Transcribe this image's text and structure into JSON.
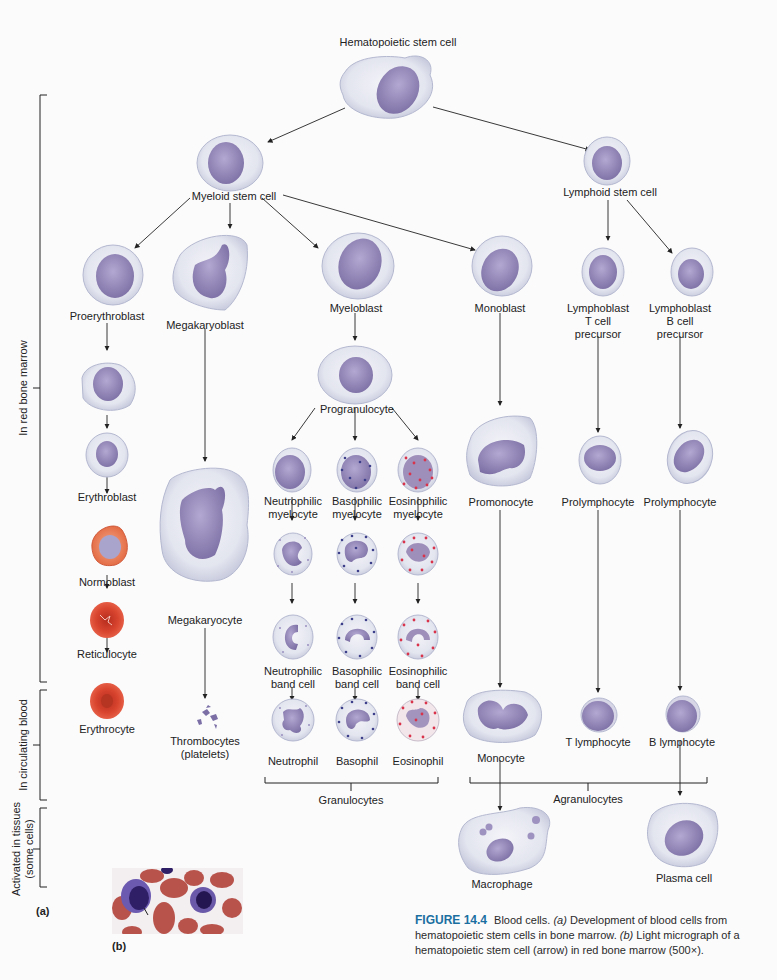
{
  "figure": {
    "number": "FIGURE 14.4",
    "caption_main": "Blood cells.",
    "caption_a_tag": "(a)",
    "caption_a_text": "Development of blood cells from hematopoietic stem cells in bone marrow.",
    "caption_b_tag": "(b)",
    "caption_b_text": "Light micrograph of a hematopoietic stem cell (arrow) in red bone marrow (500×).",
    "panel_a_label": "(a)",
    "panel_b_label": "(b)",
    "accent_color": "#1a6fa0"
  },
  "regions": {
    "bone_marrow": "In red bone marrow",
    "circulating": "In circulating blood",
    "tissues_line1": "Activated in tissues",
    "tissues_line2": "(some cells)"
  },
  "cells": {
    "hsc": "Hematopoietic stem cell",
    "myeloid_stem": "Myeloid stem cell",
    "lymphoid_stem": "Lymphoid stem cell",
    "proerythroblast": "Proerythroblast",
    "megakaryoblast": "Megakaryoblast",
    "myeloblast": "Myeloblast",
    "monoblast": "Monoblast",
    "lymphoblast_t_1": "Lymphoblast",
    "lymphoblast_t_2": "T cell",
    "lymphoblast_t_3": "precursor",
    "lymphoblast_b_1": "Lymphoblast",
    "lymphoblast_b_2": "B cell",
    "lymphoblast_b_3": "precursor",
    "progranulocyte": "Progranulocyte",
    "erythroblast": "Erythroblast",
    "normoblast": "Normoblast",
    "reticulocyte": "Reticulocyte",
    "erythrocyte": "Erythrocyte",
    "megakaryocyte": "Megakaryocyte",
    "thrombocytes_1": "Thrombocytes",
    "thrombocytes_2": "(platelets)",
    "neut_myelocyte_1": "Neutrophilic",
    "neut_myelocyte_2": "myelocyte",
    "baso_myelocyte_1": "Basophilic",
    "baso_myelocyte_2": "myelocyte",
    "eos_myelocyte_1": "Eosinophilic",
    "eos_myelocyte_2": "myelocyte",
    "neut_band_1": "Neutrophilic",
    "neut_band_2": "band cell",
    "baso_band_1": "Basophilic",
    "baso_band_2": "band cell",
    "eos_band_1": "Eosinophilic",
    "eos_band_2": "band cell",
    "neutrophil": "Neutrophil",
    "basophil": "Basophil",
    "eosinophil": "Eosinophil",
    "granulocytes": "Granulocytes",
    "promonocyte": "Promonocyte",
    "prolymphocyte_t": "Prolymphocyte",
    "prolymphocyte_b": "Prolymphocyte",
    "monocyte": "Monocyte",
    "t_lymphocyte": "T lymphocyte",
    "b_lymphocyte": "B lymphocyte",
    "agranulocytes": "Agranulocytes",
    "macrophage": "Macrophage",
    "plasma_cell": "Plasma cell"
  },
  "colors": {
    "cytoplasm": "#e4e6f0",
    "cytoplasm_edge": "#b9bdd2",
    "nucleus": "#8f82b4",
    "rbc": "#d2442f",
    "eos_granule": "#d8334a",
    "baso_granule": "#3d3f8a"
  }
}
